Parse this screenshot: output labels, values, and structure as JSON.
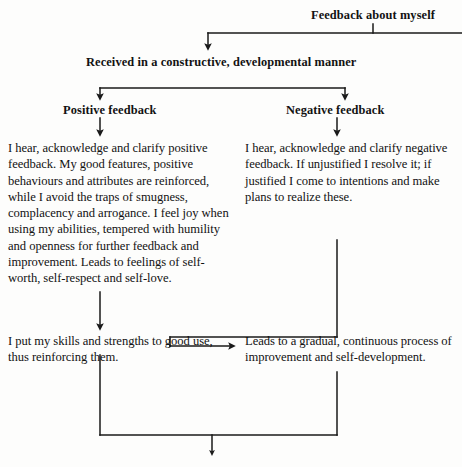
{
  "diagram": {
    "title": "Feedback about myself",
    "nodes": {
      "root": "Feedback about myself",
      "received": "Received in a constructive, developmental manner",
      "positive_label": "Positive feedback",
      "negative_label": "Negative feedback",
      "positive_body": "I hear, acknowledge and clarify positive feedback. My good features, positive behaviours and attributes are reinforced, while I avoid the traps of smugness, complacency and arrogance. I feel joy when using my abilities, tempered with humility and openness for further feedback and improvement. Leads to feelings of self-worth, self-respect and self-love.",
      "negative_body": "I hear, acknowledge and clarify negative feedback. If unjustified I resolve it; if justified I come to intentions and make plans to realize these.",
      "positive_outcome": "I put my skills and strengths to good use, thus reinforcing them.",
      "negative_outcome": "Leads to a gradual, continuous process of improvement and self-development."
    },
    "edges": [
      {
        "from": "root",
        "to": "received",
        "style": "elbow-arrow"
      },
      {
        "from": "received",
        "to": "positive_label",
        "style": "split-arrow"
      },
      {
        "from": "received",
        "to": "negative_label",
        "style": "split-arrow"
      },
      {
        "from": "positive_label",
        "to": "positive_body",
        "style": "arrow-down"
      },
      {
        "from": "negative_label",
        "to": "negative_body",
        "style": "arrow-down"
      },
      {
        "from": "positive_body",
        "to": "positive_outcome",
        "style": "arrow-down"
      },
      {
        "from": "negative_body",
        "to": "negative_outcome",
        "style": "elbow-left-arrow"
      },
      {
        "from": "positive_outcome",
        "to": "bottom-merge",
        "style": "line-down"
      },
      {
        "from": "negative_outcome",
        "to": "bottom-merge",
        "style": "line-down"
      },
      {
        "from": "bottom-merge",
        "to": "continues-below",
        "style": "arrow-down"
      }
    ],
    "colors": {
      "ink": "#121212",
      "background": "#fdfdfc",
      "connector": "#1a1a1a"
    }
  }
}
